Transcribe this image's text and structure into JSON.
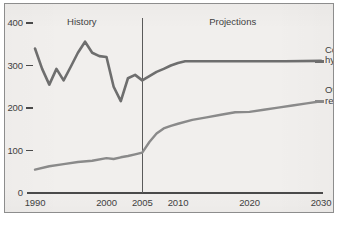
{
  "chart_data": {
    "type": "line",
    "title": "",
    "subtitle": "",
    "xlabel": "",
    "ylabel": "",
    "xlim": [
      1990,
      2030
    ],
    "ylim": [
      0,
      400
    ],
    "grid": false,
    "legend_position": "right-inline",
    "y_ticks": [
      "400",
      "300",
      "200",
      "100",
      "0"
    ],
    "y_tick_values": [
      400,
      300,
      200,
      100,
      0
    ],
    "x_ticks": [
      "1990",
      "2000",
      "2005",
      "2010",
      "2020",
      "2030"
    ],
    "x_tick_values": [
      1990,
      2000,
      2005,
      2010,
      2020,
      2030
    ],
    "annotations": [
      {
        "text": "History",
        "x": 1997,
        "note": "left of divider"
      },
      {
        "text": "Projections",
        "x": 2018,
        "note": "right of divider"
      }
    ],
    "divider": {
      "x": 2005,
      "label": "history-projection boundary"
    },
    "series": [
      {
        "name": "Conventional hydropower",
        "color": "#6e6e6e",
        "x": [
          1990,
          1991,
          1992,
          1993,
          1994,
          1995,
          1996,
          1997,
          1998,
          1999,
          2000,
          2001,
          2002,
          2003,
          2004,
          2005,
          2006,
          2007,
          2008,
          2009,
          2010,
          2011,
          2012,
          2015,
          2020,
          2025,
          2030
        ],
        "values": [
          340,
          292,
          255,
          292,
          265,
          297,
          330,
          356,
          330,
          322,
          320,
          250,
          216,
          270,
          278,
          265,
          275,
          285,
          292,
          300,
          306,
          310,
          310,
          310,
          310,
          310,
          311
        ]
      },
      {
        "name": "Other renewables",
        "color": "#8a8a8a",
        "x": [
          1990,
          1992,
          1994,
          1996,
          1998,
          2000,
          2001,
          2002,
          2003,
          2004,
          2005,
          2006,
          2007,
          2008,
          2009,
          2010,
          2012,
          2014,
          2016,
          2018,
          2020,
          2022,
          2024,
          2026,
          2028,
          2030
        ],
        "values": [
          55,
          63,
          68,
          73,
          76,
          82,
          80,
          84,
          87,
          91,
          95,
          120,
          140,
          152,
          158,
          163,
          172,
          178,
          184,
          190,
          191,
          196,
          201,
          206,
          211,
          216
        ]
      }
    ]
  },
  "labels": {
    "history": "History",
    "projections": "Projections",
    "series_one_line_one": "Conventional",
    "series_one_line_two": "hydropower",
    "series_two_line_one": "Other",
    "series_two_line_two": "renewables"
  },
  "colors": {
    "background": "#f1efed",
    "frame": "#8d8d8d",
    "axis": "#4a4a4a",
    "hydropower": "#6e6e6e",
    "renewables": "#8a8a8a",
    "text": "#3f3f3f"
  }
}
